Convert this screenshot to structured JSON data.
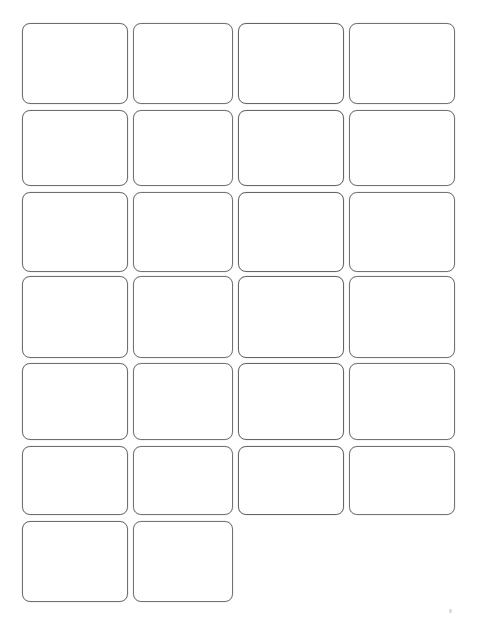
{
  "sheet": {
    "title": "Blank Card Sheet",
    "description": "Scanned sheet of blank rounded-rectangle cards",
    "background_color": "#ffffff",
    "outline_color": "#6e6e6e",
    "card_fill_color": "#ffffff",
    "page_width": 480,
    "page_height": 623,
    "total_cards": 26,
    "columns": 4,
    "rows": 7,
    "corner_radius": 8,
    "card_width": 106,
    "card_height": 81,
    "column_gap": 5,
    "row_gap": 6,
    "margin_left": 22,
    "margin_top": 23
  },
  "grid": {
    "column_x": [
      22,
      133,
      238,
      349
    ],
    "row_y": [
      23,
      110,
      192,
      276,
      363,
      446,
      521
    ],
    "row_heights": [
      81,
      76,
      80,
      82,
      77,
      69,
      81
    ],
    "rows": [
      {
        "index": 1,
        "card_count": 4,
        "cards": [
          {
            "id": "card-1-1",
            "label": "",
            "row": 1,
            "col": 1
          },
          {
            "id": "card-1-2",
            "label": "",
            "row": 1,
            "col": 2
          },
          {
            "id": "card-1-3",
            "label": "",
            "row": 1,
            "col": 3
          },
          {
            "id": "card-1-4",
            "label": "",
            "row": 1,
            "col": 4
          }
        ]
      },
      {
        "index": 2,
        "card_count": 4,
        "cards": [
          {
            "id": "card-2-1",
            "label": "",
            "row": 2,
            "col": 1
          },
          {
            "id": "card-2-2",
            "label": "",
            "row": 2,
            "col": 2
          },
          {
            "id": "card-2-3",
            "label": "",
            "row": 2,
            "col": 3
          },
          {
            "id": "card-2-4",
            "label": "",
            "row": 2,
            "col": 4
          }
        ]
      },
      {
        "index": 3,
        "card_count": 4,
        "cards": [
          {
            "id": "card-3-1",
            "label": "",
            "row": 3,
            "col": 1
          },
          {
            "id": "card-3-2",
            "label": "",
            "row": 3,
            "col": 2
          },
          {
            "id": "card-3-3",
            "label": "",
            "row": 3,
            "col": 3
          },
          {
            "id": "card-3-4",
            "label": "",
            "row": 3,
            "col": 4
          }
        ]
      },
      {
        "index": 4,
        "card_count": 4,
        "cards": [
          {
            "id": "card-4-1",
            "label": "",
            "row": 4,
            "col": 1
          },
          {
            "id": "card-4-2",
            "label": "",
            "row": 4,
            "col": 2
          },
          {
            "id": "card-4-3",
            "label": "",
            "row": 4,
            "col": 3
          },
          {
            "id": "card-4-4",
            "label": "",
            "row": 4,
            "col": 4
          }
        ]
      },
      {
        "index": 5,
        "card_count": 4,
        "cards": [
          {
            "id": "card-5-1",
            "label": "",
            "row": 5,
            "col": 1
          },
          {
            "id": "card-5-2",
            "label": "",
            "row": 5,
            "col": 2
          },
          {
            "id": "card-5-3",
            "label": "",
            "row": 5,
            "col": 3
          },
          {
            "id": "card-5-4",
            "label": "",
            "row": 5,
            "col": 4
          }
        ]
      },
      {
        "index": 6,
        "card_count": 4,
        "cards": [
          {
            "id": "card-6-1",
            "label": "",
            "row": 6,
            "col": 1
          },
          {
            "id": "card-6-2",
            "label": "",
            "row": 6,
            "col": 2
          },
          {
            "id": "card-6-3",
            "label": "",
            "row": 6,
            "col": 3
          },
          {
            "id": "card-6-4",
            "label": "",
            "row": 6,
            "col": 4
          }
        ]
      },
      {
        "index": 7,
        "card_count": 2,
        "cards": [
          {
            "id": "card-7-1",
            "label": "",
            "row": 7,
            "col": 1
          },
          {
            "id": "card-7-2",
            "label": "",
            "row": 7,
            "col": 2
          }
        ]
      }
    ]
  },
  "artifacts": [
    {
      "id": "speck-1",
      "x": 449,
      "y": 609,
      "width": 3,
      "height": 4
    }
  ]
}
